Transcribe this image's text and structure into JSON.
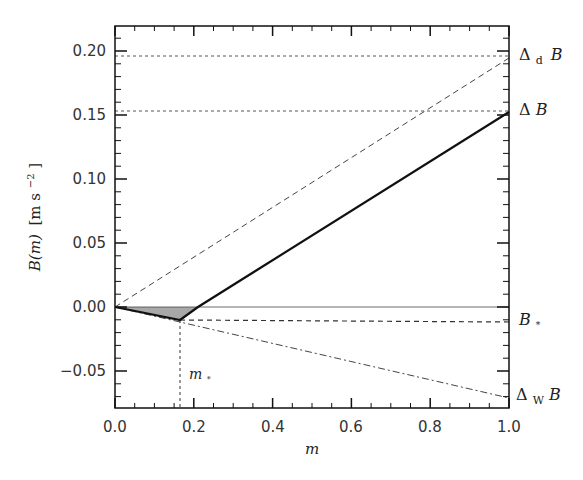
{
  "chart_data": {
    "type": "line",
    "title": "",
    "xlabel": "m",
    "ylabel": "B(m) [m s^-2]",
    "xlim": [
      0.0,
      1.0
    ],
    "ylim": [
      -0.079,
      0.22
    ],
    "x_ticks": [
      "0.0",
      "0.2",
      "0.4",
      "0.6",
      "0.8",
      "1.0"
    ],
    "y_ticks": [
      "-0.05",
      "0.00",
      "0.05",
      "0.10",
      "0.15",
      "0.20"
    ],
    "grid": false,
    "series": [
      {
        "name": "B(m) mixing line",
        "style": "solid-thick",
        "x": [
          0.0,
          0.165,
          0.21,
          1.0
        ],
        "y": [
          0.0,
          -0.01,
          0.0,
          0.152
        ]
      },
      {
        "name": "Δd B line",
        "style": "dashed",
        "x": [
          0.0,
          1.0
        ],
        "y": [
          0.0,
          0.196
        ]
      },
      {
        "name": "ΔW B line",
        "style": "dash-dot",
        "x": [
          0.0,
          1.0
        ],
        "y": [
          0.0,
          -0.071
        ]
      },
      {
        "name": "zero line",
        "style": "solid-thin",
        "x": [
          0.0,
          1.0
        ],
        "y": [
          0.0,
          0.0
        ]
      },
      {
        "name": "B* level",
        "style": "dashed",
        "x": [
          0.165,
          1.0
        ],
        "y": [
          -0.01,
          -0.012
        ]
      },
      {
        "name": "Δd B level",
        "style": "dotted",
        "x": [
          0.0,
          1.0
        ],
        "y": [
          0.196,
          0.196
        ]
      },
      {
        "name": "ΔB level",
        "style": "dotted",
        "x": [
          0.0,
          1.0
        ],
        "y": [
          0.153,
          0.153
        ]
      },
      {
        "name": "m* marker",
        "style": "dotted-vertical",
        "x": [
          0.165,
          0.165
        ],
        "y": [
          -0.01,
          -0.079
        ]
      }
    ],
    "shaded_region": {
      "x": [
        0.0,
        0.165,
        0.21
      ],
      "y": [
        0.0,
        -0.01,
        0.0
      ],
      "color": "#999999"
    },
    "annotations": [
      {
        "text": "ΔdB",
        "x": 1.0,
        "y": 0.196
      },
      {
        "text": "ΔB",
        "x": 1.0,
        "y": 0.153
      },
      {
        "text": "B*",
        "x": 1.0,
        "y": -0.012
      },
      {
        "text": "ΔWB",
        "x": 1.0,
        "y": -0.071
      },
      {
        "text": "m*",
        "x": 0.17,
        "y": -0.055
      }
    ]
  },
  "labels": {
    "xlabel": "m",
    "ylabel_main": "B(m)",
    "ylabel_unit_open": "[m s",
    "ylabel_exp": "−2",
    "ylabel_unit_close": "]",
    "delta": "Δ",
    "sub_d": "d",
    "sub_w": "W",
    "B": "B",
    "star": "*",
    "m": "m"
  },
  "ticks": {
    "x": [
      "0.0",
      "0.2",
      "0.4",
      "0.6",
      "0.8",
      "1.0"
    ],
    "y": [
      "0.20",
      "0.15",
      "0.10",
      "0.05",
      "0.00",
      "−0.05"
    ]
  }
}
